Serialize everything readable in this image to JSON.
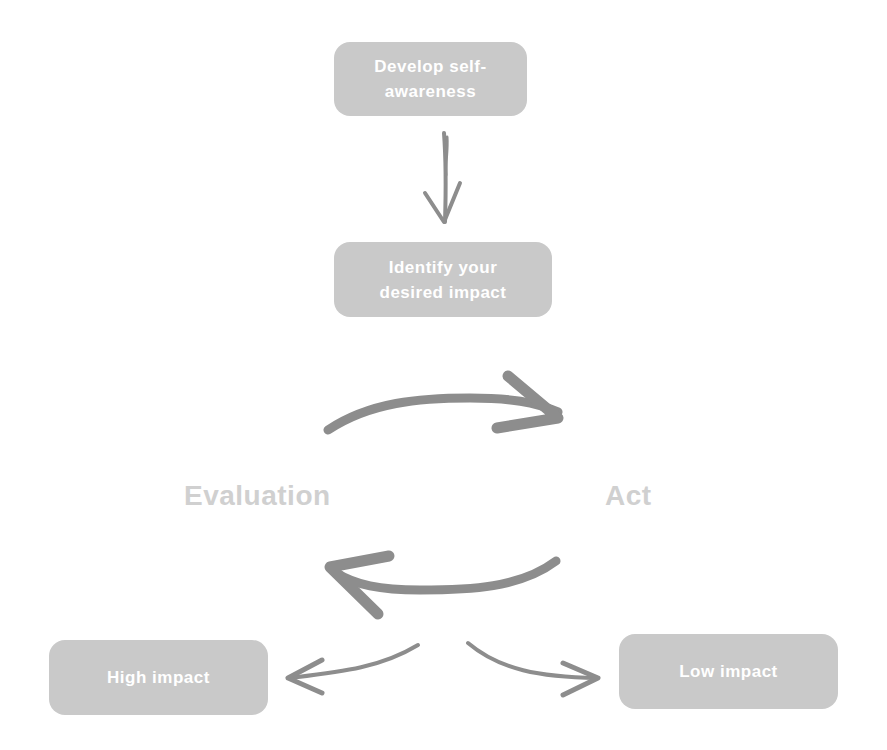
{
  "diagram": {
    "nodes": {
      "develop": {
        "label": "Develop self-awareness",
        "line1": "Develop self-",
        "line2": "awareness"
      },
      "identify": {
        "label": "Identify your desired impact",
        "line1": "Identify your",
        "line2": "desired impact"
      },
      "high": {
        "label": "High impact"
      },
      "low": {
        "label": "Low impact"
      }
    },
    "cycle_labels": {
      "evaluation": "Evaluation",
      "act": "Act"
    },
    "edges": [
      {
        "from": "Develop self-awareness",
        "to": "Identify your desired impact",
        "icon": "down-arrow-icon"
      },
      {
        "from": "Evaluation",
        "to": "Act",
        "icon": "curved-right-arrow-icon"
      },
      {
        "from": "Act",
        "to": "Evaluation",
        "icon": "curved-left-arrow-icon"
      },
      {
        "from": "Evaluation",
        "to": "High impact",
        "icon": "curved-left-arrow-icon"
      },
      {
        "from": "Evaluation",
        "to": "Low impact",
        "icon": "curved-right-arrow-icon"
      }
    ],
    "colors": {
      "box_fill": "#c9c9c9",
      "box_text": "#ffffff",
      "arrow": "#8d8d8d",
      "cycle_label": "#d0d0d0"
    }
  }
}
